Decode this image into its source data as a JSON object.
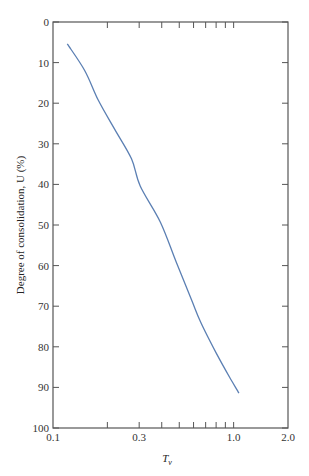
{
  "chart_data": {
    "type": "line",
    "title": "",
    "xlabel": "T_v",
    "ylabel": "Degree of consolidation, U (%)",
    "xscale": "log",
    "xlim": [
      0.1,
      2.0
    ],
    "ylim": [
      0,
      100
    ],
    "y_inverted": true,
    "grid": false,
    "legend": null,
    "x_tick_labels": [
      "0.1",
      "0.3",
      "1.0",
      "2.0"
    ],
    "x_minor_ticks": [
      0.2,
      0.3,
      0.4,
      0.5,
      0.6,
      0.7,
      0.8,
      0.9,
      1.0
    ],
    "y_tick_labels": [
      "0",
      "10",
      "20",
      "30",
      "40",
      "50",
      "60",
      "70",
      "80",
      "90",
      "100"
    ],
    "series": [
      {
        "name": "U vs Tv",
        "color": "#5b7fb3",
        "x": [
          0.12,
          0.15,
          0.178,
          0.22,
          0.272,
          0.304,
          0.393,
          0.48,
          0.585,
          0.656,
          0.8,
          0.95,
          1.07
        ],
        "y": [
          5.4,
          12.0,
          19.2,
          26.5,
          33.7,
          40.4,
          49.3,
          59.0,
          68.5,
          73.9,
          81.5,
          87.5,
          91.4
        ]
      }
    ]
  },
  "labels": {
    "y_axis_title": "Degree of consolidation, U (%)",
    "x_axis_title_main": "T",
    "x_axis_title_sub": "v"
  }
}
